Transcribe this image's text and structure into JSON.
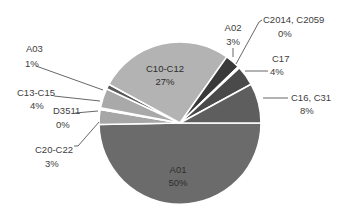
{
  "chart_data": {
    "type": "pie",
    "title": "",
    "slices": [
      {
        "label": "A01",
        "value": 50,
        "display": "50%",
        "color": "#6b6b6b"
      },
      {
        "label": "C20-C22",
        "value": 3,
        "display": "3%",
        "color": "#a6a6a6"
      },
      {
        "label": "D3511",
        "value": 0.3,
        "display": "0%",
        "color": "#8c8c8c"
      },
      {
        "label": "C13-C15",
        "value": 4,
        "display": "4%",
        "color": "#a9a9a9"
      },
      {
        "label": "A03",
        "value": 1,
        "display": "1%",
        "color": "#5a5a5a"
      },
      {
        "label": "C10-C12",
        "value": 27,
        "display": "27%",
        "color": "#b3b3b3"
      },
      {
        "label": "A02",
        "value": 3,
        "display": "3%",
        "color": "#3a3a3a"
      },
      {
        "label": "C2014, C2059",
        "value": 0.3,
        "display": "0%",
        "color": "#2a2a2a"
      },
      {
        "label": "C17",
        "value": 4,
        "display": "4%",
        "color": "#4a4a4a"
      },
      {
        "label": "C16, C31",
        "value": 8,
        "display": "8%",
        "color": "#5e5e5e"
      }
    ],
    "legend": "none (data labels with leader lines)"
  },
  "labels": {
    "a01": {
      "name": "A01",
      "pct": "50%"
    },
    "c20": {
      "name": "C20-C22",
      "pct": "3%"
    },
    "d3511": {
      "name": "D3511",
      "pct": "0%"
    },
    "c13": {
      "name": "C13-C15",
      "pct": "4%"
    },
    "a03": {
      "name": "A03",
      "pct": "1%"
    },
    "c10": {
      "name": "C10-C12",
      "pct": "27%"
    },
    "a02": {
      "name": "A02",
      "pct": "3%"
    },
    "c2014": {
      "name": "C2014, C2059",
      "pct": "0%"
    },
    "c17": {
      "name": "C17",
      "pct": "4%"
    },
    "c16": {
      "name": "C16, C31",
      "pct": "8%"
    }
  }
}
